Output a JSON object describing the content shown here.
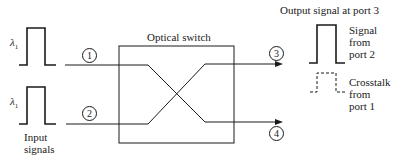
{
  "title": "Optical switch",
  "inputs": {
    "label_line1": "Input",
    "label_line2": "signals",
    "wavelength_symbol": "λ",
    "wavelength_subscript": "1",
    "ports": [
      {
        "number": "1"
      },
      {
        "number": "2"
      }
    ]
  },
  "outputs": {
    "ports": [
      {
        "number": "3"
      },
      {
        "number": "4"
      }
    ],
    "panel_title": "Output signal at port 3",
    "signal_label": [
      "Signal",
      "from",
      "port 2"
    ],
    "crosstalk_label": [
      "Crosstalk",
      "from",
      "port 1"
    ]
  },
  "colors": {
    "line": "#1a1a1a",
    "background": "#ffffff"
  }
}
